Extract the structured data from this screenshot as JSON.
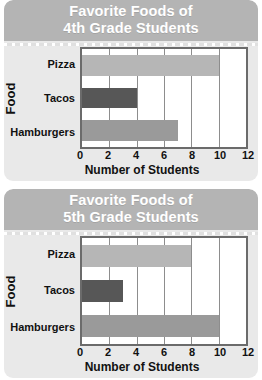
{
  "chart_data": [
    {
      "type": "bar",
      "orientation": "horizontal",
      "title": "Favorite Foods of 4th Grade Students",
      "title_lines": [
        "Favorite Foods of",
        "4th Grade Students"
      ],
      "categories": [
        "Pizza",
        "Tacos",
        "Hamburgers"
      ],
      "values": [
        10,
        4,
        7
      ],
      "xlabel": "Number of Students",
      "ylabel": "Food",
      "xlim": [
        0,
        12
      ],
      "xticks": [
        0,
        2,
        4,
        6,
        8,
        10,
        12
      ],
      "xtick_labels": [
        "0",
        "2",
        "4",
        "6",
        "8",
        "10",
        "12"
      ],
      "grid": true,
      "legend": false,
      "bar_colors": [
        "#b6b6b6",
        "#575757",
        "#9a9a9a"
      ]
    },
    {
      "type": "bar",
      "orientation": "horizontal",
      "title": "Favorite Foods of 5th Grade Students",
      "title_lines": [
        "Favorite Foods of",
        "5th Grade Students"
      ],
      "categories": [
        "Pizza",
        "Tacos",
        "Hamburgers"
      ],
      "values": [
        8,
        3,
        10
      ],
      "xlabel": "Number of Students",
      "ylabel": "Food",
      "xlim": [
        0,
        12
      ],
      "xticks": [
        0,
        2,
        4,
        6,
        8,
        10,
        12
      ],
      "xtick_labels": [
        "0",
        "2",
        "4",
        "6",
        "8",
        "10",
        "12"
      ],
      "grid": true,
      "legend": false,
      "bar_colors": [
        "#b6b6b6",
        "#575757",
        "#9a9a9a"
      ]
    }
  ],
  "colors": {
    "card_background": "#e9e9e9",
    "title_banner": "#b4b4b4",
    "title_text": "#ffffff",
    "plot_background": "#ffffff",
    "plot_border": "#6b6b6b",
    "gridline": "#8d8d8d",
    "axis_text": "#111111"
  }
}
